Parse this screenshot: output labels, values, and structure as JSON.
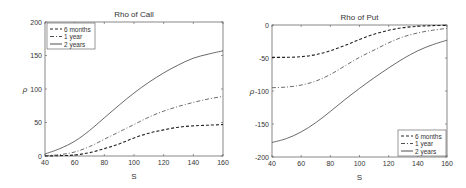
{
  "chart_data": [
    {
      "type": "line",
      "title": "Rho of Call",
      "xlabel": "S",
      "ylabel": "ρ",
      "xlim": [
        40,
        160
      ],
      "ylim": [
        0,
        200
      ],
      "xticks": [
        40,
        60,
        80,
        100,
        120,
        140,
        160
      ],
      "yticks": [
        0,
        50,
        100,
        150,
        200
      ],
      "legend_position": "upper left",
      "grid": false,
      "x": [
        40,
        50,
        60,
        70,
        80,
        90,
        100,
        110,
        120,
        130,
        140,
        150,
        160
      ],
      "series": [
        {
          "name": "6 months",
          "style": "dashed",
          "values": [
            0,
            0.5,
            1.5,
            5,
            11,
            18,
            27,
            34,
            39,
            43,
            45,
            46,
            47
          ]
        },
        {
          "name": "1 year",
          "style": "dashdot",
          "values": [
            0.5,
            2,
            6,
            14,
            25,
            36,
            47,
            58,
            67,
            74,
            80,
            85,
            89
          ]
        },
        {
          "name": "2 years",
          "style": "solid",
          "values": [
            3,
            11,
            22,
            38,
            57,
            76,
            94,
            110,
            124,
            136,
            146,
            152,
            157
          ]
        }
      ]
    },
    {
      "type": "line",
      "title": "Rho of Put",
      "xlabel": "S",
      "ylabel": "ρ",
      "xlim": [
        40,
        160
      ],
      "ylim": [
        -200,
        0
      ],
      "xticks": [
        40,
        60,
        80,
        100,
        120,
        140,
        160
      ],
      "yticks": [
        -200,
        -150,
        -100,
        -50,
        0
      ],
      "legend_position": "lower right",
      "grid": false,
      "x": [
        40,
        50,
        60,
        70,
        80,
        90,
        100,
        110,
        120,
        130,
        140,
        150,
        160
      ],
      "series": [
        {
          "name": "6 months",
          "style": "dashed",
          "values": [
            -49,
            -49,
            -48,
            -45,
            -39,
            -31,
            -22,
            -14,
            -8,
            -4,
            -2,
            -1,
            -0.5
          ]
        },
        {
          "name": "1 year",
          "style": "dashdot",
          "values": [
            -95,
            -94,
            -91,
            -85,
            -75,
            -62,
            -49,
            -38,
            -27,
            -18,
            -12,
            -8,
            -5
          ]
        },
        {
          "name": "2 years",
          "style": "solid",
          "values": [
            -178,
            -172,
            -162,
            -148,
            -131,
            -113,
            -96,
            -80,
            -65,
            -51,
            -39,
            -30,
            -23
          ]
        }
      ]
    }
  ]
}
